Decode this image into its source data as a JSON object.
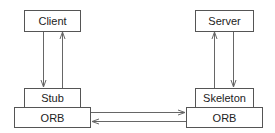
{
  "diagram": {
    "nodes": {
      "client": "Client",
      "stub": "Stub",
      "orb_left": "ORB",
      "server": "Server",
      "skeleton": "Skeleton",
      "orb_right": "ORB"
    },
    "edges": [
      {
        "from": "Client",
        "to": "Stub"
      },
      {
        "from": "Stub",
        "to": "Client"
      },
      {
        "from": "Server",
        "to": "Skeleton"
      },
      {
        "from": "Skeleton",
        "to": "Server"
      },
      {
        "from": "ORB (client)",
        "to": "ORB (server)"
      },
      {
        "from": "ORB (server)",
        "to": "ORB (client)"
      }
    ]
  }
}
